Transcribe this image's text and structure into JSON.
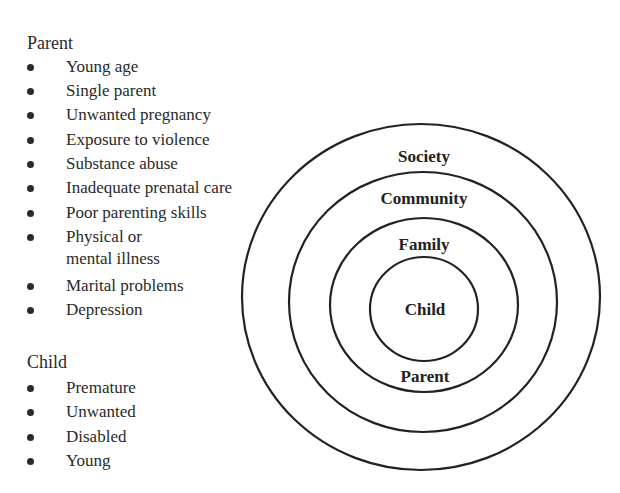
{
  "parent_factors": {
    "heading": "Parent",
    "items": [
      "Young age",
      "Single parent",
      "Unwanted pregnancy",
      "Exposure to violence",
      "Substance abuse",
      "Inadequate prenatal care",
      "Poor parenting skills",
      "Physical or",
      "Marital problems",
      "Depression"
    ],
    "item_7_line2": "mental illness"
  },
  "child_factors": {
    "heading": "Child",
    "items": [
      "Premature",
      "Unwanted",
      "Disabled",
      "Young"
    ]
  },
  "diagram": {
    "type": "concentric-circles",
    "rings": {
      "society": "Society",
      "community": "Community",
      "family": "Family",
      "child": "Child",
      "parent": "Parent"
    }
  }
}
